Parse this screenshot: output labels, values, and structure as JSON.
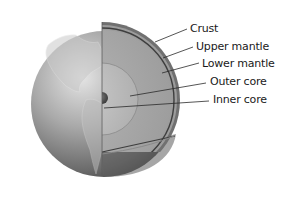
{
  "labels": [
    {
      "id": "crust",
      "text": "Crust",
      "x": 190,
      "y": 23
    },
    {
      "id": "upper-mantle",
      "text": "Upper mantle",
      "x": 196,
      "y": 41
    },
    {
      "id": "lower-mantle",
      "text": "Lower mantle",
      "x": 202,
      "y": 58
    },
    {
      "id": "outer-core",
      "text": "Outer core",
      "x": 210,
      "y": 76
    },
    {
      "id": "inner-core",
      "text": "Inner core",
      "x": 213,
      "y": 94
    }
  ],
  "colors": {
    "background": "#ffffff",
    "globe_light": "#d8d8d8",
    "globe_dark": "#5a5a5a",
    "crust": "#6e6e6e",
    "mantle": "#a8a8a8",
    "outer_core": "#bdbdbd",
    "inner_core": "#4a4a4a",
    "leader_line": "#2a2a2a"
  }
}
